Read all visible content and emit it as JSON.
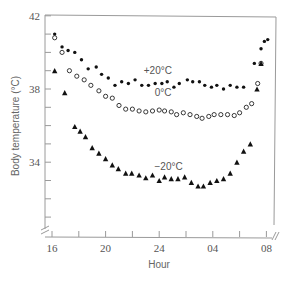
{
  "chart_data": {
    "type": "scatter",
    "title": "",
    "xlabel": "Hour",
    "ylabel": "Body temperature (°C)",
    "xlim_hours_since_16": [
      0,
      16
    ],
    "ylim": [
      30.5,
      42
    ],
    "x_ticks": [
      {
        "label": "16",
        "t": 0
      },
      {
        "label": "",
        "t": 2
      },
      {
        "label": "20",
        "t": 4
      },
      {
        "label": "",
        "t": 6
      },
      {
        "label": "24",
        "t": 8
      },
      {
        "label": "",
        "t": 10
      },
      {
        "label": "04",
        "t": 12
      },
      {
        "label": "",
        "t": 14
      },
      {
        "label": "08",
        "t": 16
      }
    ],
    "y_ticks": [
      {
        "label": "42",
        "v": 42
      },
      {
        "label": "",
        "v": 41
      },
      {
        "label": "",
        "v": 40
      },
      {
        "label": "",
        "v": 39
      },
      {
        "label": "38",
        "v": 38
      },
      {
        "label": "",
        "v": 37
      },
      {
        "label": "",
        "v": 36
      },
      {
        "label": "",
        "v": 35
      },
      {
        "label": "34",
        "v": 34
      },
      {
        "label": "",
        "v": 33
      },
      {
        "label": "",
        "v": 32
      },
      {
        "label": "",
        "v": 31
      }
    ],
    "grid": false,
    "axis_breaks": [
      "y-axis bottom",
      "x-axis right"
    ],
    "series": [
      {
        "name": "+20°C",
        "marker": "filled-circle",
        "label_pos": {
          "t": 7.9,
          "v": 38.8
        },
        "points": [
          [
            0.2,
            41.0
          ],
          [
            0.75,
            40.3
          ],
          [
            1.2,
            40.1
          ],
          [
            1.7,
            40.0
          ],
          [
            2.2,
            39.6
          ],
          [
            2.7,
            39.1
          ],
          [
            3.3,
            39.2
          ],
          [
            3.7,
            38.8
          ],
          [
            4.2,
            38.6
          ],
          [
            4.7,
            38.2
          ],
          [
            5.2,
            38.4
          ],
          [
            5.7,
            38.3
          ],
          [
            6.2,
            38.5
          ],
          [
            6.7,
            38.2
          ],
          [
            7.2,
            38.2
          ],
          [
            7.7,
            38.3
          ],
          [
            8.2,
            38.3
          ],
          [
            8.6,
            38.4
          ],
          [
            9.1,
            38.1
          ],
          [
            9.5,
            38.3
          ],
          [
            10.1,
            38.5
          ],
          [
            10.5,
            38.4
          ],
          [
            11.0,
            38.4
          ],
          [
            11.4,
            38.2
          ],
          [
            11.9,
            38.1
          ],
          [
            12.3,
            38.2
          ],
          [
            12.8,
            38.0
          ],
          [
            13.3,
            38.2
          ],
          [
            13.8,
            38.1
          ],
          [
            14.3,
            38.1
          ],
          [
            15.1,
            39.4
          ],
          [
            15.6,
            40.2
          ],
          [
            15.85,
            40.6
          ],
          [
            16.1,
            40.7
          ]
        ]
      },
      {
        "name": "0°C",
        "marker": "open-circle",
        "label_pos": {
          "t": 8.3,
          "v": 37.6
        },
        "points": [
          [
            0.2,
            40.8
          ],
          [
            0.75,
            40.0
          ],
          [
            1.3,
            39.0
          ],
          [
            1.85,
            38.7
          ],
          [
            2.4,
            38.5
          ],
          [
            2.9,
            38.2
          ],
          [
            3.5,
            37.9
          ],
          [
            4.0,
            37.6
          ],
          [
            4.5,
            37.5
          ],
          [
            5.0,
            37.1
          ],
          [
            5.5,
            36.9
          ],
          [
            6.0,
            36.9
          ],
          [
            6.5,
            36.8
          ],
          [
            7.0,
            36.75
          ],
          [
            7.5,
            36.8
          ],
          [
            8.0,
            36.85
          ],
          [
            8.4,
            36.8
          ],
          [
            8.9,
            36.75
          ],
          [
            9.3,
            36.6
          ],
          [
            9.8,
            36.7
          ],
          [
            10.3,
            36.6
          ],
          [
            10.8,
            36.5
          ],
          [
            11.2,
            36.4
          ],
          [
            11.7,
            36.5
          ],
          [
            12.1,
            36.6
          ],
          [
            12.6,
            36.6
          ],
          [
            13.1,
            36.6
          ],
          [
            13.6,
            36.55
          ],
          [
            14.0,
            36.7
          ],
          [
            14.5,
            37.0
          ],
          [
            14.9,
            37.2
          ],
          [
            15.35,
            38.3
          ],
          [
            15.6,
            39.4
          ]
        ]
      },
      {
        "name": "−20°C",
        "marker": "filled-triangle",
        "label_pos": {
          "t": 8.7,
          "v": 33.6
        },
        "points": [
          [
            0.2,
            39.0
          ],
          [
            0.95,
            37.8
          ],
          [
            1.7,
            35.95
          ],
          [
            2.1,
            35.7
          ],
          [
            2.5,
            35.4
          ],
          [
            3.0,
            34.8
          ],
          [
            3.5,
            34.5
          ],
          [
            4.0,
            34.2
          ],
          [
            4.5,
            33.85
          ],
          [
            4.95,
            33.65
          ],
          [
            5.5,
            33.4
          ],
          [
            5.95,
            33.4
          ],
          [
            6.5,
            33.3
          ],
          [
            7.0,
            33.15
          ],
          [
            7.5,
            33.3
          ],
          [
            8.0,
            33.0
          ],
          [
            8.4,
            33.2
          ],
          [
            8.9,
            33.1
          ],
          [
            9.4,
            33.1
          ],
          [
            9.9,
            33.2
          ],
          [
            10.4,
            32.9
          ],
          [
            10.9,
            32.7
          ],
          [
            11.3,
            32.7
          ],
          [
            11.8,
            32.9
          ],
          [
            12.3,
            33.0
          ],
          [
            12.8,
            33.1
          ],
          [
            13.3,
            33.4
          ],
          [
            13.8,
            34.0
          ],
          [
            14.3,
            34.6
          ],
          [
            14.8,
            35.0
          ],
          [
            15.3,
            38.0
          ],
          [
            15.6,
            39.4
          ]
        ]
      }
    ]
  }
}
